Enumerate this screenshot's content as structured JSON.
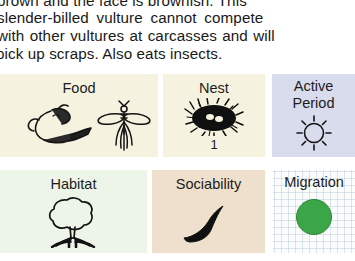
{
  "description": {
    "lines": [
      "brown and the face is brownish. This",
      "slender-billed vulture cannot compete",
      "with other vultures at carcasses and will",
      "pick up scraps. Also eats insects."
    ]
  },
  "cards": [
    {
      "id": "food",
      "label": "Food",
      "sub": "",
      "icons": [
        "carcass-icon",
        "insect-icon"
      ],
      "background": "#f6f2e0"
    },
    {
      "id": "nest",
      "label": "Nest",
      "sub": "1",
      "icons": [
        "nest-icon"
      ],
      "background": "#f6f2e0"
    },
    {
      "id": "active-period",
      "label": "Active\nPeriod",
      "label_line1": "Active",
      "label_line2": "Period",
      "sub": "",
      "icons": [
        "sun-icon"
      ],
      "background": "#d9dcec"
    },
    {
      "id": "habitat",
      "label": "Habitat",
      "sub": "",
      "icons": [
        "tree-icon"
      ],
      "background": "#edf5e9"
    },
    {
      "id": "sociability",
      "label": "Sociability",
      "sub": "",
      "icons": [
        "single-bird-in-flight-icon"
      ],
      "background": "#eee0cc"
    },
    {
      "id": "migration",
      "label": "Migration",
      "sub": "",
      "icons": [
        "green-circle-resident-icon"
      ],
      "background": "#fbfdfd",
      "dot_color": "#3ba648"
    }
  ]
}
